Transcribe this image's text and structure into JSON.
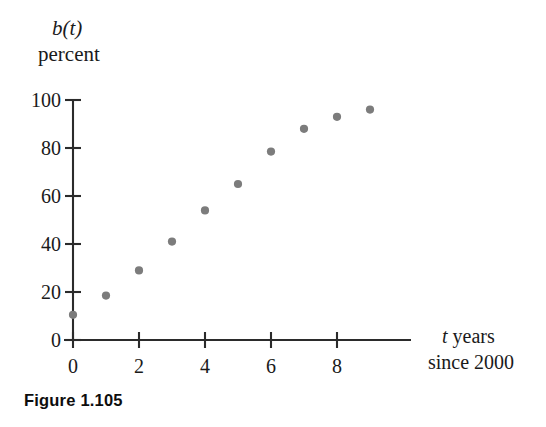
{
  "figure": {
    "caption": "Figure 1.105"
  },
  "chart_data": {
    "type": "scatter",
    "title": "",
    "ylabel_function": "b(t)",
    "ylabel_units": "percent",
    "xlabel_line1_italic": "t",
    "xlabel_line1_rest": " years",
    "xlabel_line2": "since 2000",
    "xlabel_full": "t years since 2000",
    "ylabel_full": "b(t) percent",
    "x": [
      0,
      1,
      2,
      3,
      4,
      5,
      6,
      7,
      8,
      9
    ],
    "values": [
      10.5,
      18.5,
      29,
      41,
      54,
      65,
      78.5,
      88,
      93,
      96
    ],
    "xlim": [
      0,
      10.2
    ],
    "ylim": [
      0,
      100
    ],
    "xticks": [
      0,
      2,
      4,
      6,
      8
    ],
    "yticks": [
      0,
      20,
      40,
      60,
      80,
      100
    ],
    "xtick_labels": [
      "0",
      "2",
      "4",
      "6",
      "8"
    ],
    "ytick_labels": [
      "0",
      "20",
      "40",
      "60",
      "80",
      "100"
    ],
    "grid": false,
    "legend": "none",
    "marker_color": "#7c7c7c",
    "axis_color": "#2b2b2b",
    "marker_radius": 4.1
  }
}
